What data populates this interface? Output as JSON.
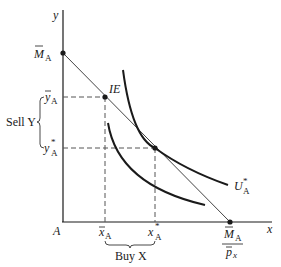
{
  "figure": {
    "axes": {
      "x_label": "x",
      "y_label": "y",
      "origin_label": "A"
    },
    "labels": {
      "M_tilde_main": "M",
      "M_tilde_sub": "A",
      "y_bar_main": "y",
      "y_bar_sub": "A",
      "y_star_main": "y",
      "y_star_sup": "*",
      "y_star_sub": "A",
      "x_bar_main": "x",
      "x_bar_sub": "A",
      "x_star_main": "x",
      "x_star_sup": "*",
      "x_star_sub": "A",
      "intercept_num_main": "M",
      "intercept_num_sub": "A",
      "intercept_den_main": "p",
      "intercept_den_sub": "x",
      "IE": "IE",
      "U_main": "U",
      "U_sup": "*",
      "U_sub": "A",
      "sell_y": "Sell Y",
      "buy_x": "Buy X"
    },
    "colors": {
      "line": "#1a1a1a",
      "budget": "#444444",
      "dashed": "#555555"
    }
  }
}
